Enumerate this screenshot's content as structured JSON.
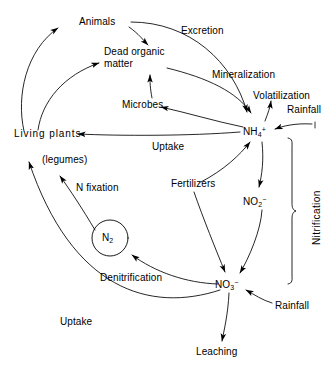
{
  "diagram": {
    "type": "cycle-diagram",
    "background_color": "#ffffff",
    "line_color": "#000000"
  },
  "nodes": {
    "animals": "Animals",
    "dead_organic_1": "Dead organic",
    "dead_organic_2": "matter",
    "microbes": "Microbes",
    "living_plants": "Living plants",
    "legumes": "(legumes)",
    "n2_main": "N",
    "n2_sub": "2",
    "nh4_main": "NH",
    "nh4_sub": "4",
    "nh4_sup": "+",
    "no2_main": "NO",
    "no2_sub": "2",
    "no2_sup": "−",
    "no3_main": "NO",
    "no3_sub": "3",
    "no3_sup": "−"
  },
  "processes": {
    "excretion": "Excretion",
    "mineralization": "Mineralization",
    "volatilization": "Volatilization",
    "rainfall_top": "Rainfall",
    "uptake_top": "Uptake",
    "n_fixation": "N fixation",
    "fertilizers": "Fertilizers",
    "nitrification": "Nitrification",
    "denitrification": "Denitrification",
    "uptake_bottom": "Uptake",
    "rainfall_bottom": "Rainfall",
    "leaching": "Leaching"
  }
}
